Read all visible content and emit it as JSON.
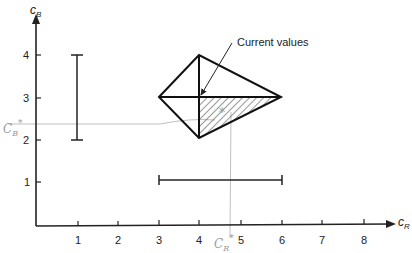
{
  "diagram": {
    "x_axis": {
      "label": "c",
      "label_sub": "R",
      "ticks": [
        "1",
        "2",
        "3",
        "4",
        "5",
        "6",
        "7",
        "8"
      ]
    },
    "y_axis": {
      "label": "c",
      "label_sub": "B",
      "ticks": [
        "1",
        "2",
        "3",
        "4"
      ]
    },
    "annotation": "Current values",
    "handwritten": {
      "cb_star": {
        "base": "C",
        "sub": "B",
        "sup": "*"
      },
      "cr_star": {
        "base": "C",
        "sub": "R",
        "sup": "*"
      }
    },
    "shapes": {
      "kite_vertices": [
        [
          3,
          3
        ],
        [
          4,
          4
        ],
        [
          6,
          3
        ],
        [
          4,
          2
        ]
      ],
      "center": [
        4,
        3
      ],
      "shaded_triangle": [
        [
          4,
          3
        ],
        [
          6,
          3
        ],
        [
          4,
          2
        ]
      ],
      "vertical_range_bar": {
        "x": 1,
        "y_from": 2,
        "y_to": 4
      },
      "horizontal_range_bar": {
        "y": 1,
        "x_from": 3,
        "x_to": 6
      },
      "cb_star_value": 2.4,
      "cr_star_value": 4.5
    }
  }
}
